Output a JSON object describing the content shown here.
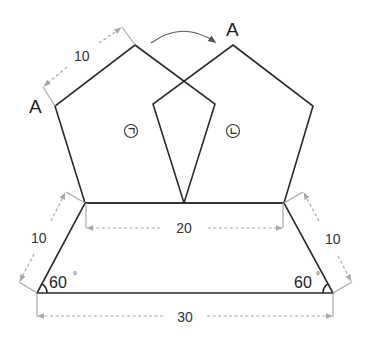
{
  "figure": {
    "type": "geometry-diagram",
    "colors": {
      "outline": "#2a2a2a",
      "dimension": "#a8a8a8",
      "background": "#ffffff"
    }
  },
  "labels": {
    "vertex_a_left": "A",
    "vertex_a_right": "A",
    "pentagon_left": "ㄱ",
    "pentagon_right": "ㄴ",
    "pentagon_side": "10",
    "trapezoid_top": "20",
    "trapezoid_bottom": "30",
    "trapezoid_left_leg": "10",
    "trapezoid_right_leg": "10",
    "angle_left": "60",
    "angle_right": "60",
    "degree_symbol": "°"
  },
  "rotation_arrow": {
    "icon": "curved-arrow-right-icon"
  }
}
